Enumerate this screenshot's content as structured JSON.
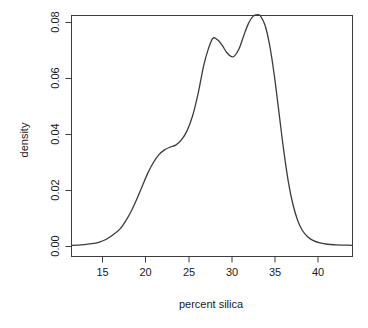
{
  "chart_data": {
    "type": "line",
    "title": "",
    "subtitle": "",
    "xlabel": "percent silica",
    "ylabel": "density",
    "xlim": [
      12.8,
      43.0
    ],
    "ylim": [
      0.0,
      0.0855
    ],
    "grid": false,
    "legend": null,
    "xticks": [
      15,
      20,
      25,
      30,
      35,
      40
    ],
    "xtick_labels": [
      "15",
      "20",
      "25",
      "30",
      "35",
      "40"
    ],
    "yticks": [
      0.0,
      0.02,
      0.04,
      0.06,
      0.08
    ],
    "ytick_labels": [
      "0.00",
      "0.02",
      "0.04",
      "0.06",
      "0.08"
    ],
    "series": [
      {
        "name": "density",
        "color": "#3c3c3c",
        "x": [
          12.8,
          13.5,
          14.2,
          15.0,
          15.8,
          16.5,
          17.2,
          18.0,
          18.6,
          19.2,
          19.8,
          20.4,
          21.0,
          21.6,
          22.2,
          22.8,
          23.4,
          24.0,
          24.6,
          25.2,
          25.8,
          26.4,
          27.0,
          27.5,
          28.0,
          28.5,
          29.0,
          29.5,
          30.0,
          30.3,
          30.8,
          31.3,
          31.8,
          32.3,
          32.8,
          33.1,
          33.6,
          34.1,
          34.6,
          35.1,
          35.6,
          36.1,
          36.6,
          37.1,
          37.6,
          38.2,
          38.8,
          39.5,
          40.3,
          41.2,
          42.1,
          43.0
        ],
        "y": [
          0.0004,
          0.0005,
          0.0007,
          0.001,
          0.0016,
          0.0025,
          0.004,
          0.0062,
          0.009,
          0.0125,
          0.0168,
          0.0215,
          0.0262,
          0.03,
          0.0328,
          0.0345,
          0.0355,
          0.0362,
          0.038,
          0.0412,
          0.0465,
          0.0545,
          0.0645,
          0.0705,
          0.0744,
          0.0738,
          0.0718,
          0.0692,
          0.0678,
          0.068,
          0.0705,
          0.0752,
          0.0795,
          0.0822,
          0.0828,
          0.0824,
          0.079,
          0.0718,
          0.061,
          0.0478,
          0.0345,
          0.0232,
          0.015,
          0.0094,
          0.0058,
          0.0034,
          0.0021,
          0.0013,
          0.0008,
          0.0006,
          0.0005,
          0.0004
        ]
      }
    ],
    "annotations": []
  },
  "axes": {
    "x_axis_name": "percent silica",
    "y_axis_name": "density"
  }
}
